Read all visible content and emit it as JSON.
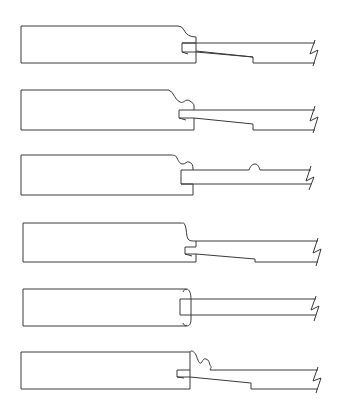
{
  "diagram": {
    "type": "joint-profile-cross-sections",
    "background": "#ffffff",
    "line_color": "#3a3a3a",
    "profiles": [
      {
        "id": "profile-1",
        "name": "groove-with-quarter-round-edge-and-tapered-tongue",
        "paths": [
          "M21,26 L178,26 Q182,26 184,30 Q187,37 196,37 L196,43 L182,43 L182,52 L196,52 L196,63 L21,63 Z",
          "M182,52 L188,54",
          "M196,43 L315,43",
          "M196,51 L253,57 L253,63 L315,63",
          "M182,43 L196,43 L196,52 L253,57",
          "M315,40 L310,54 L318,50 L313,66"
        ]
      },
      {
        "id": "profile-2",
        "name": "groove-with-ogee-edge-and-tapered-tongue",
        "paths": [
          "M21,90 L169,90 C170,92 172,91 173,94 C176,98 176,100 180,102 C184,104 185,98 190,101 C193,103 194,104 194,106 L194,110 L179,110 L179,118 L194,118 L194,130 L21,130 Z",
          "M179,118 L186,120",
          "M194,110 L315,110",
          "M194,118 L253,124 L253,130 L315,130",
          "M315,106 L310,121 L318,117 L313,133"
        ]
      },
      {
        "id": "profile-3",
        "name": "groove-with-ogee-edge-and-straight-beaded-tongue",
        "paths": [
          "M21,155 L172,155 C174,156 175,154 177,158 C179,162 180,164 183,164 C186,164 186,161 189,162 C192,163 193,165 193,169 L193,170 L181,170 L181,184 L193,184 L193,195 L21,195 Z",
          "M193,170 L249,170 C250,167 252,164 255,164 C258,164 259,167 260,170 L311,170",
          "M181,184 L311,184",
          "M311,166 L306,181 L314,177 L309,190"
        ]
      },
      {
        "id": "profile-4",
        "name": "groove-with-cove-edge-and-tapered-tongue",
        "paths": [
          "M23,223 L181,223 C183,224 183,221 185,225 C187,230 186,236 188,239 C189,241 192,241 196,241 L196,247 L185,247 L185,254 L196,254 L196,262 L23,262 Z",
          "M185,254 L192,256",
          "M196,241 L318,241",
          "M196,254 L255,259 L255,262 L318,262",
          "M318,238 L313,253 L321,249 L316,266"
        ]
      },
      {
        "id": "profile-5",
        "name": "groove-with-rounded-ends-and-straight-tongue",
        "paths": [
          "M23,289 L186,289 C190,289 191,294 191,300 L191,318 C191,324 190,326 186,326 L23,326 Z",
          "M183,292 C184,289 186,289 187,290",
          "M183,323 C184,326 186,326 187,325",
          "M191,299 L180,299 L180,315 L191,315",
          "M191,299 L316,299",
          "M191,315 L316,315",
          "M316,296 L311,310 L319,306 L314,321"
        ]
      },
      {
        "id": "profile-6",
        "name": "groove-with-double-bead-edge-and-tapered-tongue",
        "paths": [
          "M21,352 L190,352 L190,389 L21,389 Z",
          "M190,352 C191,350 194,351 196,355 C198,360 199,364 201,363 C203,361 203,358 206,359 C209,360 209,362 210,365 C211,367 212,366 210,370",
          "M190,370 L177,370 L177,377 L190,377",
          "M177,377 L184,378",
          "M210,370 L318,370",
          "M190,377 L251,383 L251,389 L318,389",
          "M318,367 L313,381 L321,378 L316,393"
        ]
      }
    ]
  }
}
